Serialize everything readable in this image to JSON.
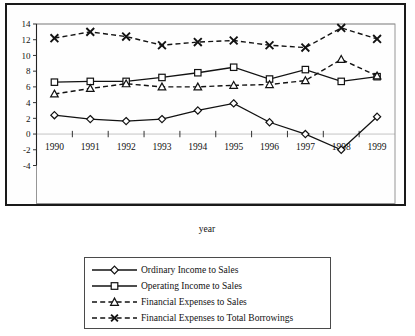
{
  "chart_data": {
    "type": "line",
    "title": "",
    "xlabel": "year",
    "ylabel": "",
    "categories": [
      "1990",
      "1991",
      "1992",
      "1993",
      "1994",
      "1995",
      "1996",
      "1997",
      "1998",
      "1999"
    ],
    "x": [
      1990,
      1991,
      1992,
      1993,
      1994,
      1995,
      1996,
      1997,
      1998,
      1999
    ],
    "ylim": [
      -4,
      14
    ],
    "ytick_labels": [
      "14",
      "12",
      "10",
      "8",
      "6",
      "4",
      "2",
      "0",
      "-2",
      "-4"
    ],
    "yticks": [
      14,
      12,
      10,
      8,
      6,
      4,
      2,
      0,
      -2,
      -4
    ],
    "grid": true,
    "legend_position": "below-plot",
    "series": [
      {
        "name": "Ordinary Income to Sales",
        "marker": "diamond",
        "linestyle": "solid",
        "color": "#121212",
        "values": [
          2.4,
          1.9,
          1.65,
          1.9,
          3.0,
          3.9,
          1.5,
          0.0,
          -2.0,
          2.2
        ]
      },
      {
        "name": "Operating Income to Sales",
        "marker": "square",
        "linestyle": "solid",
        "color": "#121212",
        "values": [
          6.6,
          6.7,
          6.7,
          7.2,
          7.8,
          8.5,
          7.0,
          8.2,
          6.7,
          7.3
        ]
      },
      {
        "name": "Financial Expenses to Sales",
        "marker": "triangle",
        "linestyle": "dashed",
        "color": "#121212",
        "values": [
          5.1,
          5.8,
          6.4,
          6.0,
          6.0,
          6.2,
          6.3,
          6.8,
          9.5,
          7.4
        ]
      },
      {
        "name": "Financial Expenses to Total Borrowings",
        "marker": "x",
        "linestyle": "dashed",
        "color": "#121212",
        "values": [
          12.2,
          13.0,
          12.4,
          11.3,
          11.7,
          11.9,
          11.3,
          11.0,
          13.5,
          12.1
        ]
      }
    ]
  },
  "legend": {
    "items": [
      {
        "label": "Ordinary Income to Sales",
        "marker": "diamond",
        "linestyle": "solid"
      },
      {
        "label": "Operating Income to Sales",
        "marker": "square",
        "linestyle": "solid"
      },
      {
        "label": "Financial Expenses to Sales",
        "marker": "triangle",
        "linestyle": "dashed"
      },
      {
        "label": "Financial Expenses to Total Borrowings",
        "marker": "x",
        "linestyle": "dashed"
      }
    ]
  },
  "colors": {
    "ink": "#121212",
    "grid": "#b5b5b5",
    "frame": "#1a1a1a",
    "paper": "#ffffff"
  }
}
